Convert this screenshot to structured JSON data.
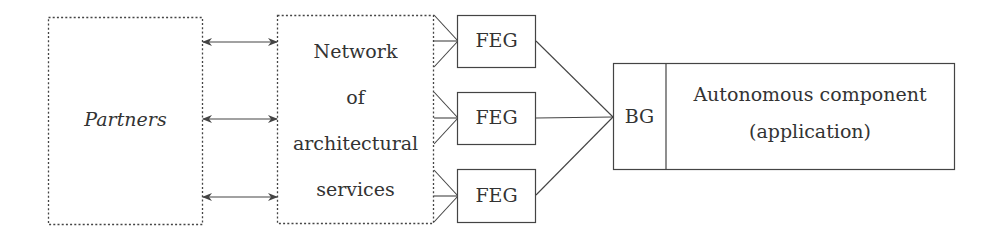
{
  "diagram": {
    "partners": {
      "label": "Partners"
    },
    "network": {
      "lines": [
        "Network",
        "of",
        "architectural",
        "services"
      ]
    },
    "fegs": [
      {
        "label": "FEG"
      },
      {
        "label": "FEG"
      },
      {
        "label": "FEG"
      }
    ],
    "bg": {
      "label": "BG"
    },
    "application": {
      "lines": [
        "Autonomous component",
        "(application)"
      ]
    },
    "arrows": {
      "count": 3,
      "type": "bidirectional"
    },
    "colors": {
      "stroke": "#444444",
      "background": "#ffffff",
      "text": "#333333"
    }
  }
}
